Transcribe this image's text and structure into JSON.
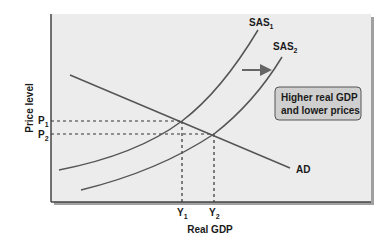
{
  "diagram": {
    "axes": {
      "y_label": "Price level",
      "x_label": "Real GDP"
    },
    "curves": {
      "sas1": {
        "label": "SAS",
        "sub": "1"
      },
      "sas2": {
        "label": "SAS",
        "sub": "2"
      },
      "ad": {
        "label": "AD"
      }
    },
    "ticks": {
      "p1": {
        "label": "P",
        "sub": "1"
      },
      "p2": {
        "label": "P",
        "sub": "2"
      },
      "y1": {
        "label": "Y",
        "sub": "1"
      },
      "y2": {
        "label": "Y",
        "sub": "2"
      }
    },
    "callout": {
      "line1": "Higher real GDP",
      "line2": "and lower prices"
    },
    "colors": {
      "plot_bg": "#ececec",
      "curve": "#555555",
      "arrow": "#666666",
      "callout_bg": "#cfcfcf",
      "callout_border": "#555555",
      "shadow": "#9a9a9a"
    }
  }
}
